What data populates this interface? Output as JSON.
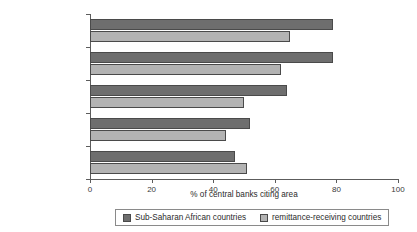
{
  "chart_data": {
    "type": "bar",
    "orientation": "horizontal",
    "title": "",
    "xlabel": "% of central banks citing area",
    "ylabel": "",
    "xlim": [
      0,
      100
    ],
    "xticks": [
      0,
      20,
      40,
      60,
      80,
      100
    ],
    "xtick_labels": [
      "0",
      "20",
      "40",
      "60",
      "80",
      "100"
    ],
    "grid": false,
    "legend_position": "bottom",
    "categories": [
      "better statistics and\nstudies on migrants",
      "better statistics on\nremittances",
      "delivery of remittances\nto remote areas",
      "increased competition\namong RSPs",
      "new technologies/\nproducts for providing\nremittances services"
    ],
    "series": [
      {
        "name": "Sub-Saharan African countries",
        "color": "#6e6e6e",
        "values": [
          79,
          79,
          64,
          52,
          47
        ]
      },
      {
        "name": "remittance-receiving countries",
        "color": "#b3b3b3",
        "values": [
          65,
          62,
          50,
          44,
          51
        ]
      }
    ]
  },
  "title_sliver": "",
  "colors": {
    "series_dark": "#6e6e6e",
    "series_light": "#b3b3b3",
    "axis": "#5c5c5c",
    "text": "#2b2b2b",
    "legend_border": "#8a8a8a"
  }
}
